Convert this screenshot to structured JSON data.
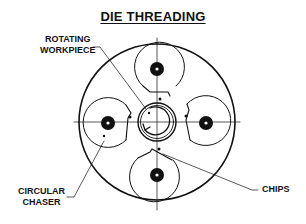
{
  "title": "DIE THREADING",
  "labels": {
    "workpiece_line1": "ROTATING",
    "workpiece_line2": "WORKPIECE",
    "chaser_line1": "CIRCULAR",
    "chaser_line2": "CHASER",
    "chips": "CHIPS"
  },
  "colors": {
    "ink": "#111111",
    "background": "#ffffff"
  }
}
